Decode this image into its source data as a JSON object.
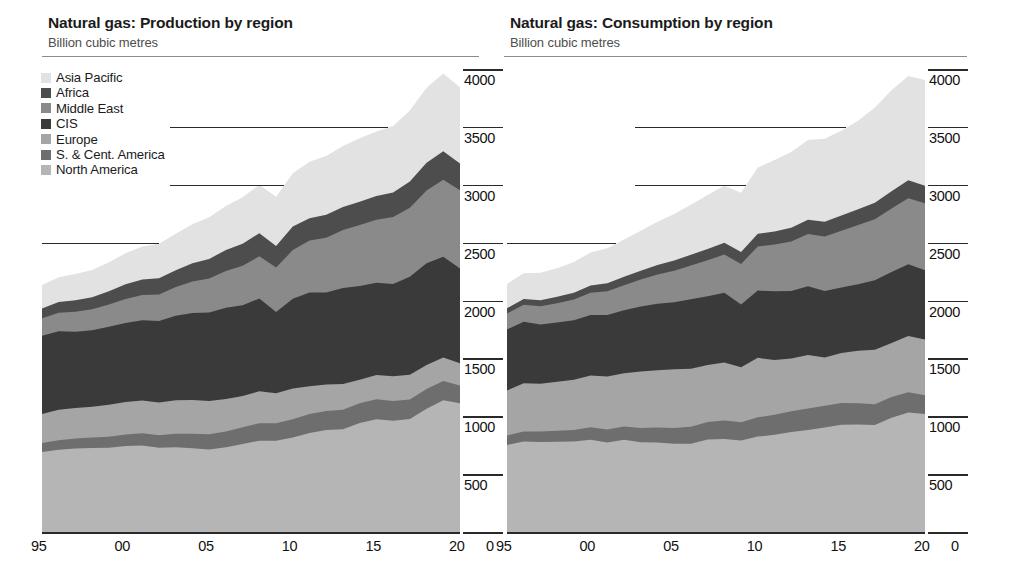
{
  "palette": {
    "asia_pacific": "#e2e2e2",
    "africa": "#4d4d4d",
    "middle_east": "#8a8a8a",
    "cis": "#3a3a3a",
    "europe": "#a5a5a5",
    "s_cent_america": "#6e6e6e",
    "north_america": "#b5b5b5",
    "axis": "#2a2a2a",
    "rule": "#8c8c8c",
    "text": "#1b1b1b",
    "subtext": "#4e4e4e"
  },
  "legend": {
    "items": [
      {
        "label": "Asia Pacific",
        "key": "asia_pacific",
        "color": "#e2e2e2"
      },
      {
        "label": "Africa",
        "key": "africa",
        "color": "#4d4d4d"
      },
      {
        "label": "Middle East",
        "key": "middle_east",
        "color": "#8a8a8a"
      },
      {
        "label": "CIS",
        "key": "cis",
        "color": "#3a3a3a"
      },
      {
        "label": "Europe",
        "key": "europe",
        "color": "#a5a5a5"
      },
      {
        "label": "S. & Cent. America",
        "key": "s_cent_america",
        "color": "#6e6e6e"
      },
      {
        "label": "North America",
        "key": "north_america",
        "color": "#b5b5b5"
      }
    ]
  },
  "axis": {
    "y_ticks": [
      4000,
      3500,
      3000,
      2500,
      2000,
      1500,
      1000,
      500
    ],
    "y_zero_label": "0",
    "y_min": 0,
    "y_max": 4000,
    "x_ticks": [
      "95",
      "00",
      "05",
      "10",
      "15",
      "20"
    ],
    "x_tick_years": [
      1995,
      2000,
      2005,
      2010,
      2015,
      2020
    ],
    "x_min": 1995,
    "x_max": 2020
  },
  "chart_data": [
    {
      "type": "area",
      "stacked": true,
      "title": "Natural gas: Production by region",
      "subtitle": "Billion cubic metres",
      "xlabel": "",
      "ylabel": "Billion cubic metres",
      "ylim": [
        0,
        4000
      ],
      "grid": true,
      "legend_position": "top-left",
      "x": [
        1995,
        1996,
        1997,
        1998,
        1999,
        2000,
        2001,
        2002,
        2003,
        2004,
        2005,
        2006,
        2007,
        2008,
        2009,
        2010,
        2011,
        2012,
        2013,
        2014,
        2015,
        2016,
        2017,
        2018,
        2019,
        2020
      ],
      "stack_order_bottom_to_top": [
        "North America",
        "S. & Cent. America",
        "Europe",
        "CIS",
        "Middle East",
        "Africa",
        "Asia Pacific"
      ],
      "series": [
        {
          "name": "North America",
          "values": [
            700,
            720,
            730,
            735,
            737,
            752,
            757,
            737,
            741,
            733,
            722,
            740,
            769,
            798,
            798,
            825,
            864,
            889,
            896,
            950,
            983,
            970,
            984,
            1073,
            1146,
            1120
          ]
        },
        {
          "name": "S. & Cent. America",
          "values": [
            77,
            82,
            86,
            90,
            95,
            100,
            105,
            108,
            117,
            125,
            131,
            137,
            144,
            151,
            150,
            157,
            163,
            166,
            169,
            171,
            173,
            170,
            170,
            170,
            167,
            154
          ]
        },
        {
          "name": "Europe",
          "values": [
            252,
            263,
            263,
            265,
            277,
            280,
            282,
            282,
            288,
            290,
            287,
            281,
            270,
            276,
            259,
            267,
            241,
            229,
            223,
            203,
            209,
            214,
            213,
            208,
            203,
            193
          ]
        },
        {
          "name": "CIS",
          "values": [
            675,
            678,
            660,
            661,
            673,
            683,
            694,
            705,
            731,
            753,
            764,
            788,
            785,
            801,
            703,
            775,
            809,
            794,
            828,
            810,
            797,
            798,
            846,
            879,
            870,
            818
          ]
        },
        {
          "name": "Middle East",
          "values": [
            151,
            160,
            172,
            181,
            193,
            207,
            219,
            229,
            248,
            272,
            295,
            317,
            340,
            365,
            384,
            420,
            450,
            472,
            501,
            526,
            545,
            578,
            598,
            630,
            665,
            676
          ]
        },
        {
          "name": "Africa",
          "values": [
            84,
            93,
            99,
            105,
            113,
            127,
            134,
            140,
            146,
            158,
            168,
            183,
            190,
            199,
            185,
            203,
            192,
            200,
            199,
            201,
            205,
            212,
            225,
            239,
            246,
            231
          ]
        },
        {
          "name": "Asia Pacific",
          "values": [
            203,
            214,
            227,
            236,
            251,
            268,
            284,
            297,
            315,
            337,
            360,
            379,
            403,
            419,
            425,
            461,
            488,
            508,
            527,
            549,
            556,
            574,
            615,
            648,
            673,
            659
          ]
        }
      ],
      "totals": [
        2142,
        2210,
        2237,
        2273,
        2339,
        2417,
        2475,
        2498,
        2586,
        2668,
        2727,
        2825,
        2901,
        3009,
        2904,
        3108,
        3207,
        3258,
        3343,
        3410,
        3468,
        3516,
        3651,
        3847,
        3970,
        3851
      ]
    },
    {
      "type": "area",
      "stacked": true,
      "title": "Natural gas: Consumption by region",
      "subtitle": "Billion cubic metres",
      "xlabel": "",
      "ylabel": "Billion cubic metres",
      "ylim": [
        0,
        4000
      ],
      "grid": true,
      "legend_position": "none",
      "x": [
        1995,
        1996,
        1997,
        1998,
        1999,
        2000,
        2001,
        2002,
        2003,
        2004,
        2005,
        2006,
        2007,
        2008,
        2009,
        2010,
        2011,
        2012,
        2013,
        2014,
        2015,
        2016,
        2017,
        2018,
        2019,
        2020
      ],
      "stack_order_bottom_to_top": [
        "North America",
        "S. & Cent. America",
        "Europe",
        "CIS",
        "Middle East",
        "Africa",
        "Asia Pacific"
      ],
      "series": [
        {
          "name": "North America",
          "values": [
            760,
            790,
            786,
            788,
            790,
            806,
            782,
            805,
            785,
            781,
            770,
            772,
            807,
            812,
            800,
            833,
            848,
            872,
            890,
            911,
            936,
            938,
            932,
            995,
            1041,
            1028
          ]
        },
        {
          "name": "S. & Cent. America",
          "values": [
            82,
            87,
            91,
            95,
            100,
            107,
            112,
            115,
            123,
            131,
            138,
            146,
            152,
            159,
            157,
            166,
            173,
            179,
            185,
            188,
            188,
            184,
            181,
            179,
            175,
            162
          ]
        },
        {
          "name": "Europe",
          "values": [
            390,
            416,
            412,
            424,
            434,
            447,
            457,
            460,
            487,
            495,
            506,
            501,
            492,
            503,
            475,
            514,
            473,
            456,
            462,
            418,
            430,
            452,
            470,
            468,
            485,
            482
          ]
        },
        {
          "name": "CIS",
          "values": [
            527,
            533,
            513,
            512,
            515,
            524,
            533,
            544,
            561,
            574,
            580,
            600,
            595,
            601,
            542,
            581,
            594,
            583,
            594,
            574,
            568,
            576,
            601,
            613,
            620,
            598
          ]
        },
        {
          "name": "Middle East",
          "values": [
            138,
            147,
            157,
            166,
            178,
            191,
            205,
            217,
            233,
            252,
            272,
            292,
            311,
            332,
            351,
            381,
            405,
            428,
            452,
            470,
            489,
            511,
            527,
            548,
            572,
            578
          ]
        },
        {
          "name": "Africa",
          "values": [
            45,
            49,
            52,
            55,
            59,
            64,
            68,
            72,
            76,
            82,
            88,
            92,
            96,
            101,
            103,
            110,
            112,
            119,
            123,
            127,
            131,
            137,
            143,
            150,
            155,
            152
          ]
        },
        {
          "name": "Asia Pacific",
          "values": [
            210,
            223,
            238,
            248,
            265,
            285,
            302,
            323,
            347,
            375,
            403,
            432,
            468,
            492,
            512,
            572,
            617,
            655,
            690,
            718,
            733,
            764,
            822,
            872,
            901,
            913
          ]
        }
      ],
      "totals": [
        2152,
        2245,
        2249,
        2288,
        2341,
        2424,
        2459,
        2536,
        2612,
        2690,
        2757,
        2835,
        2921,
        3000,
        2940,
        3157,
        3222,
        3292,
        3396,
        3406,
        3475,
        3562,
        3676,
        3825,
        3949,
        3913
      ]
    }
  ]
}
